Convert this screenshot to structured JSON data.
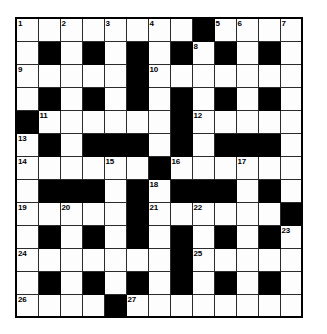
{
  "puzzle": {
    "title": "Crossword Grid",
    "type": "crossword",
    "rows": 13,
    "cols": 13,
    "cell_size_px": 22,
    "colors": {
      "block": "#000000",
      "cell": "#fdfdfd",
      "grid_line": "#2b2b2b",
      "border": "#000000",
      "number_text": "#000000"
    },
    "legend": {
      "white_cell": "open-letter-cell",
      "black_cell": "blocked-cell"
    },
    "grid": [
      [
        "W",
        "W",
        "W",
        "W",
        "W",
        "W",
        "W",
        "W",
        "B",
        "W",
        "W",
        "W",
        "W"
      ],
      [
        "W",
        "B",
        "W",
        "B",
        "W",
        "B",
        "W",
        "B",
        "W",
        "B",
        "W",
        "B",
        "W"
      ],
      [
        "W",
        "W",
        "W",
        "W",
        "W",
        "B",
        "W",
        "W",
        "W",
        "W",
        "W",
        "W",
        "W"
      ],
      [
        "W",
        "B",
        "W",
        "B",
        "W",
        "B",
        "W",
        "B",
        "W",
        "B",
        "W",
        "B",
        "W"
      ],
      [
        "B",
        "W",
        "W",
        "W",
        "W",
        "W",
        "W",
        "B",
        "W",
        "W",
        "W",
        "W",
        "W"
      ],
      [
        "W",
        "B",
        "W",
        "B",
        "B",
        "B",
        "W",
        "B",
        "W",
        "B",
        "B",
        "B",
        "W"
      ],
      [
        "W",
        "W",
        "W",
        "W",
        "W",
        "W",
        "B",
        "W",
        "W",
        "W",
        "W",
        "W",
        "W"
      ],
      [
        "W",
        "B",
        "B",
        "B",
        "W",
        "B",
        "W",
        "B",
        "B",
        "B",
        "W",
        "B",
        "W"
      ],
      [
        "W",
        "W",
        "W",
        "W",
        "W",
        "B",
        "W",
        "W",
        "W",
        "W",
        "W",
        "W",
        "B"
      ],
      [
        "W",
        "B",
        "W",
        "B",
        "W",
        "B",
        "W",
        "B",
        "W",
        "B",
        "W",
        "B",
        "W"
      ],
      [
        "W",
        "W",
        "W",
        "W",
        "W",
        "W",
        "W",
        "B",
        "W",
        "W",
        "W",
        "W",
        "W"
      ],
      [
        "W",
        "B",
        "W",
        "B",
        "W",
        "B",
        "W",
        "B",
        "W",
        "B",
        "W",
        "B",
        "W"
      ],
      [
        "W",
        "W",
        "W",
        "W",
        "B",
        "W",
        "W",
        "W",
        "W",
        "W",
        "W",
        "W",
        "W"
      ]
    ],
    "numbers": [
      {
        "row": 0,
        "col": 0,
        "label": "1"
      },
      {
        "row": 0,
        "col": 2,
        "label": "2"
      },
      {
        "row": 0,
        "col": 4,
        "label": "3"
      },
      {
        "row": 0,
        "col": 6,
        "label": "4"
      },
      {
        "row": 0,
        "col": 9,
        "label": "5"
      },
      {
        "row": 0,
        "col": 10,
        "label": "6"
      },
      {
        "row": 0,
        "col": 12,
        "label": "7"
      },
      {
        "row": 1,
        "col": 8,
        "label": "8"
      },
      {
        "row": 2,
        "col": 0,
        "label": "9"
      },
      {
        "row": 2,
        "col": 6,
        "label": "10"
      },
      {
        "row": 4,
        "col": 1,
        "label": "11"
      },
      {
        "row": 4,
        "col": 8,
        "label": "12"
      },
      {
        "row": 5,
        "col": 0,
        "label": "13"
      },
      {
        "row": 6,
        "col": 0,
        "label": "14"
      },
      {
        "row": 6,
        "col": 4,
        "label": "15"
      },
      {
        "row": 6,
        "col": 7,
        "label": "16"
      },
      {
        "row": 6,
        "col": 10,
        "label": "17"
      },
      {
        "row": 7,
        "col": 6,
        "label": "18"
      },
      {
        "row": 8,
        "col": 0,
        "label": "19"
      },
      {
        "row": 8,
        "col": 2,
        "label": "20"
      },
      {
        "row": 8,
        "col": 6,
        "label": "21"
      },
      {
        "row": 8,
        "col": 8,
        "label": "22"
      },
      {
        "row": 9,
        "col": 12,
        "label": "23"
      },
      {
        "row": 10,
        "col": 0,
        "label": "24"
      },
      {
        "row": 10,
        "col": 8,
        "label": "25"
      },
      {
        "row": 12,
        "col": 0,
        "label": "26"
      },
      {
        "row": 12,
        "col": 5,
        "label": "27"
      }
    ]
  }
}
